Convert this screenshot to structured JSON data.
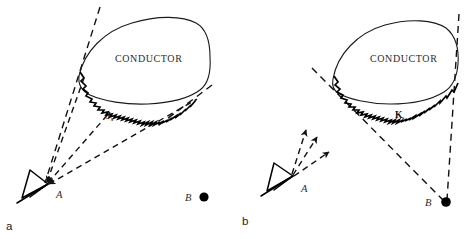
{
  "figure": {
    "panels": [
      {
        "id": "a",
        "panel_label": "a",
        "conductor_label": "CONDUCTOR",
        "current_symbol": "J",
        "current_subscript": "s",
        "observer_point_label": "A",
        "source_point_label": "B",
        "observer_icon": "eye-cone-icon",
        "source_icon": "filled-dot-icon",
        "ray_direction": "inward-toward-A",
        "ray_count": 3
      },
      {
        "id": "b",
        "panel_label": "b",
        "conductor_label": "CONDUCTOR",
        "current_symbol": "K",
        "current_subscript": "s",
        "observer_point_label": "A",
        "source_point_label": "B",
        "observer_icon": "eye-cone-icon",
        "source_icon": "filled-dot-icon",
        "ray_direction": "outward-from-A",
        "ray_count": 3
      }
    ],
    "colors": {
      "ink": "#111111",
      "outline": "#1a1a1a",
      "text": "#2b2b2b",
      "background": "#ffffff"
    }
  }
}
